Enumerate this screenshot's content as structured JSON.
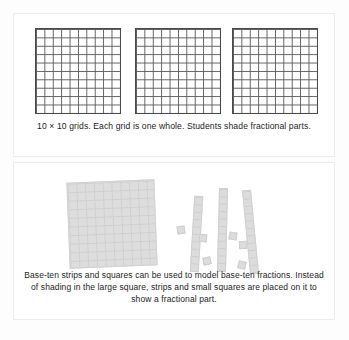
{
  "panels": [
    {
      "id": "ten-by-ten-grids",
      "caption": "10 × 10 grids. Each grid is one whole.\nStudents shade fractional parts.",
      "grids": [
        {
          "label": "grid-1",
          "rows": 10,
          "cols": 10,
          "shaded_cells": 0
        },
        {
          "label": "grid-2",
          "rows": 10,
          "cols": 10,
          "shaded_cells": 0
        },
        {
          "label": "grid-3",
          "rows": 10,
          "cols": 10,
          "shaded_cells": 0
        }
      ]
    },
    {
      "id": "base-ten-manipulatives",
      "caption": "Base-ten strips and squares can be used to model base-ten fractions. Instead of shading in the large square, strips and small squares are placed on it to show a fractional part.",
      "pieces": {
        "large_square": {
          "rows": 10,
          "cols": 10,
          "name": "hundred-flat"
        },
        "strips": [
          {
            "name": "ten-strip",
            "units": 10
          },
          {
            "name": "ten-strip",
            "units": 10
          },
          {
            "name": "ten-strip",
            "units": 10
          }
        ],
        "unit_squares": [
          {
            "name": "one-unit"
          },
          {
            "name": "one-unit"
          },
          {
            "name": "one-unit"
          },
          {
            "name": "one-unit"
          },
          {
            "name": "one-unit"
          },
          {
            "name": "one-unit"
          }
        ]
      }
    }
  ],
  "colors": {
    "page_background": "#fdfdfd",
    "panel_background": "#ffffff",
    "panel_border": "#ececed",
    "grid_line": "#5d5d5d",
    "grid_border": "#4a4a4a",
    "manipulative_fill": "#dcdcdc",
    "manipulative_line": "#cfcfcf",
    "caption_text": "#242424"
  }
}
